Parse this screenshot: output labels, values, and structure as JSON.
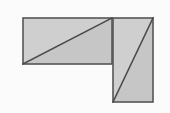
{
  "figure": {
    "width": 170,
    "height": 113,
    "background_color": "#fbfbfb",
    "colors": {
      "background": "#fbfbfb",
      "fill_upper": "#cfcfcf",
      "fill_lower": "#c6c6c6",
      "outline": "#555555",
      "diagonal": "#4a4a4a"
    },
    "stroke_widths": {
      "outline": 1.6,
      "diagonal": 1.6
    },
    "shapes": [
      {
        "name": "horizontal-rectangle",
        "x": 23,
        "y": 18,
        "width": 89,
        "height": 46,
        "diagonal": "bottom-left-to-top-right",
        "parts": [
          {
            "name": "upper-left-triangle",
            "points": "23,18 112,18 23,64",
            "fill": "#cfcfcf"
          },
          {
            "name": "lower-right-triangle",
            "points": "23,64 112,18 112,64",
            "fill": "#c6c6c6"
          }
        ]
      },
      {
        "name": "vertical-rectangle",
        "x": 113,
        "y": 18,
        "width": 40,
        "height": 84,
        "diagonal": "bottom-left-to-top-right",
        "parts": [
          {
            "name": "upper-left-triangle",
            "points": "113,18 153,18 113,102",
            "fill": "#cfcfcf"
          },
          {
            "name": "lower-right-triangle",
            "points": "113,102 153,18 153,102",
            "fill": "#c6c6c6"
          }
        ]
      }
    ],
    "diagonal_lines": [
      {
        "name": "horizontal-rectangle-diagonal",
        "x1": 23,
        "y1": 64,
        "x2": 112,
        "y2": 18
      },
      {
        "name": "vertical-rectangle-diagonal",
        "x1": 113,
        "y1": 102,
        "x2": 153,
        "y2": 18
      }
    ],
    "outlines": [
      {
        "name": "horizontal-rectangle-outline",
        "x": 23,
        "y": 18,
        "width": 89,
        "height": 46
      },
      {
        "name": "vertical-rectangle-outline",
        "x": 113,
        "y": 18,
        "width": 40,
        "height": 84
      }
    ]
  }
}
